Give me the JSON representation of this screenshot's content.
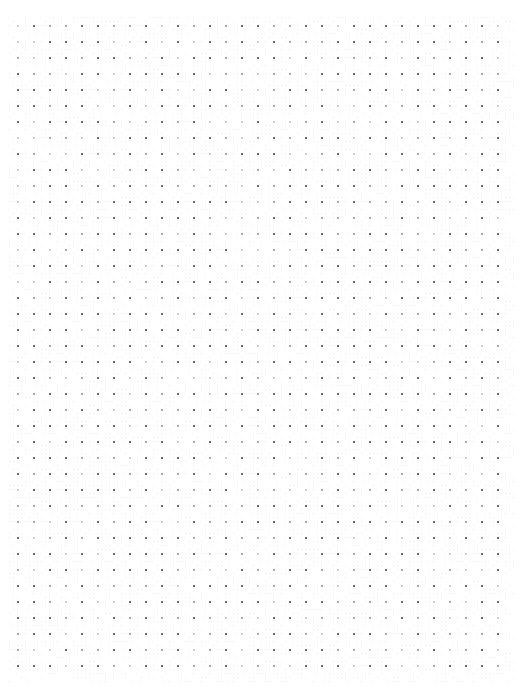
{
  "page": {
    "kind": "dot-grid-notebook-page",
    "content_text": "",
    "width_px": 524,
    "height_px": 693,
    "background_color": "#ffffff"
  },
  "grid": {
    "pattern_name": "dot-grid",
    "dot_color": "#6b6b74",
    "dot_color_soft": "#a9a9b4",
    "dot_color_softest": "#cfcfd8",
    "texture_color": "#ededf2",
    "dot_size_px": 2,
    "spacing_px": 16,
    "origin_x_px": 17,
    "origin_y_px": 25,
    "columns": 31,
    "rows": 41,
    "margin_left_px": 17,
    "margin_top_px": 25,
    "margin_right_px": 19,
    "margin_bottom_px": 21
  },
  "texture": {
    "enabled": true,
    "micro_dot_size_px": 1,
    "micro_spacing_px": 4,
    "opacity": 0.55
  }
}
